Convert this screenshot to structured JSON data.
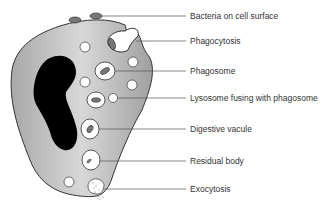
{
  "labels": [
    {
      "id": "bacteria",
      "text": "Bacteria on cell surface",
      "y": 16
    },
    {
      "id": "phagocytosis",
      "text": "Phagocytosis",
      "y": 42
    },
    {
      "id": "phagosome",
      "text": "Phagosome",
      "y": 71
    },
    {
      "id": "lysosome",
      "text": "Lysosome fusing with phagosome",
      "y": 98
    },
    {
      "id": "digestive",
      "text": "Digestive vacule",
      "y": 128
    },
    {
      "id": "residual",
      "text": "Residual body",
      "y": 160
    },
    {
      "id": "exocytosis",
      "text": "Exocytosis",
      "y": 189
    }
  ],
  "colors": {
    "cytoplasm": "#b3b3b3",
    "nucleus": "#000000",
    "outline": "#333333",
    "bacteria": "#777777",
    "leader": "#555555"
  }
}
